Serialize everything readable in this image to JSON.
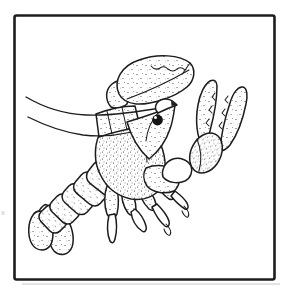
{
  "figure": {
    "title": "Black-and-white line drawing of a lobster",
    "subject": "lobster",
    "style": "stippled pen-and-ink clip-art illustration",
    "ink_color": "#1c1c1c",
    "background_color": "#ffffff",
    "frame": {
      "shape": "rectangle",
      "stroke_color": "#1c1c1c"
    }
  },
  "anatomy": {
    "claws": 2,
    "antennae": 2,
    "walking_legs": 4,
    "abdomen_segments": 5,
    "tail_fan_lobes": 3,
    "eye": {
      "color": "#151515",
      "highlight_color": "#ffffff"
    }
  }
}
